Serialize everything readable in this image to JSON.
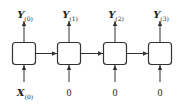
{
  "diagram": {
    "type": "rnn-unrolled-sequence",
    "cells": [
      {
        "output": {
          "var": "Y",
          "sub": "(0)"
        },
        "input": {
          "var": "X",
          "sub": "(0)"
        }
      },
      {
        "output": {
          "var": "Y",
          "sub": "(1)"
        },
        "input": {
          "text": "0"
        }
      },
      {
        "output": {
          "var": "Y",
          "sub": "(2)"
        },
        "input": {
          "text": "0"
        }
      },
      {
        "output": {
          "var": "Y",
          "sub": "(3)"
        },
        "input": {
          "text": "0"
        }
      }
    ],
    "colors": {
      "stroke": "#333333",
      "background": "#ffffff"
    }
  }
}
